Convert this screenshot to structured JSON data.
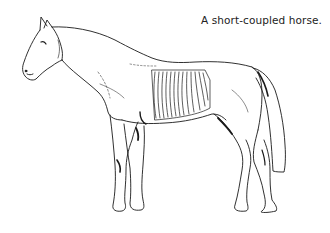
{
  "figure": {
    "caption": "A short-coupled horse.",
    "highlight": "rib-cage",
    "colors": {
      "line": "#1a1a1a",
      "background": "#ffffff"
    }
  }
}
